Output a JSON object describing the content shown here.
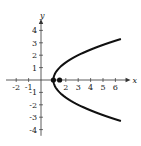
{
  "chart_data": {
    "type": "line",
    "title": "",
    "xlabel": "x",
    "ylabel": "y",
    "xlim": [
      -2.5,
      7
    ],
    "ylim": [
      -4.6,
      4.6
    ],
    "grid": false,
    "x_ticks": [
      -2,
      -1,
      1,
      2,
      3,
      4,
      5,
      6
    ],
    "x_tick_labels": [
      "-2",
      "-1",
      "",
      "2",
      "3",
      "4",
      "5",
      "6"
    ],
    "y_ticks": [
      -4,
      -3,
      -2,
      -1,
      1,
      2,
      3,
      4
    ],
    "y_tick_labels": [
      "-4",
      "-3",
      "-2",
      "-1",
      "1",
      "2",
      "3",
      "4"
    ],
    "series": [
      {
        "name": "parabola",
        "equation": "x = 1 + y^2/2",
        "points": [
          {
            "x": 6.5,
            "y": -3.3
          },
          {
            "x": 5.5,
            "y": -3.0
          },
          {
            "x": 3.0,
            "y": -2.0
          },
          {
            "x": 1.5,
            "y": -1.0
          },
          {
            "x": 1.0,
            "y": 0.0
          },
          {
            "x": 1.5,
            "y": 1.0
          },
          {
            "x": 3.0,
            "y": 2.0
          },
          {
            "x": 5.5,
            "y": 3.0
          },
          {
            "x": 6.5,
            "y": 3.3
          }
        ]
      }
    ],
    "marked_points": [
      {
        "label": "vertex",
        "x": 1.0,
        "y": 0.0
      },
      {
        "label": "focus",
        "x": 1.5,
        "y": 0.0
      }
    ]
  }
}
